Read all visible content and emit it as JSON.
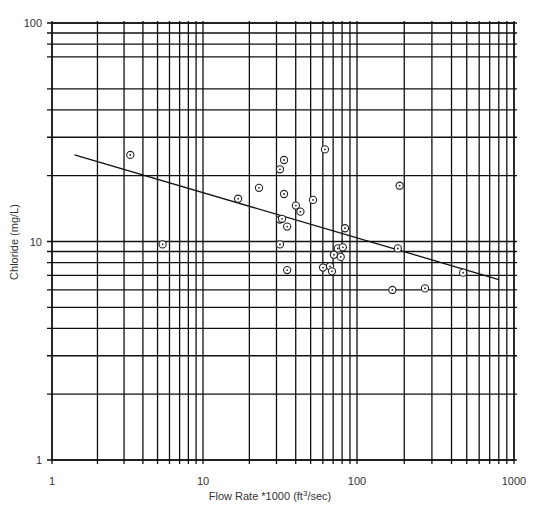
{
  "chart_data": {
    "type": "scatter",
    "title": "",
    "xlabel": "Flow Rate *1000 (ft³/sec)",
    "xlabel_parts": {
      "pre": "Flow Rate *1000 (ft",
      "sup": "3",
      "post": "/sec)"
    },
    "ylabel": "Chloride (mg/L)",
    "xscale": "log",
    "yscale": "log",
    "xlim": [
      1,
      1000
    ],
    "ylim": [
      1,
      100
    ],
    "x_tick_labels": [
      "1",
      "10",
      "100",
      "1000"
    ],
    "y_tick_labels": [
      "1",
      "10",
      "100"
    ],
    "grid": true,
    "grid_x_values": [
      1,
      2,
      3,
      4,
      5,
      6,
      7,
      8,
      9,
      10,
      20,
      30,
      40,
      50,
      60,
      70,
      80,
      90,
      100,
      200,
      300,
      400,
      500,
      600,
      700,
      800,
      900,
      1000
    ],
    "grid_y_values": [
      1,
      2,
      3,
      4,
      5,
      6,
      7,
      8,
      9,
      10,
      20,
      30,
      40,
      50,
      70,
      80,
      90,
      100
    ],
    "series": [
      {
        "name": "Observations",
        "marker": "circle-dot",
        "points": [
          {
            "x": 3.3,
            "y": 24.9
          },
          {
            "x": 5.4,
            "y": 9.7
          },
          {
            "x": 16.9,
            "y": 15.7
          },
          {
            "x": 23.1,
            "y": 17.6
          },
          {
            "x": 33.6,
            "y": 23.6
          },
          {
            "x": 31.6,
            "y": 21.4
          },
          {
            "x": 33.6,
            "y": 16.5
          },
          {
            "x": 51.8,
            "y": 15.5
          },
          {
            "x": 40.1,
            "y": 14.6
          },
          {
            "x": 42.9,
            "y": 13.7
          },
          {
            "x": 31.6,
            "y": 12.6
          },
          {
            "x": 32.6,
            "y": 12.7
          },
          {
            "x": 35.2,
            "y": 11.7
          },
          {
            "x": 31.6,
            "y": 9.7
          },
          {
            "x": 35.2,
            "y": 7.4
          },
          {
            "x": 61.9,
            "y": 26.4
          },
          {
            "x": 83.6,
            "y": 11.5
          },
          {
            "x": 75.1,
            "y": 9.3
          },
          {
            "x": 80.9,
            "y": 9.4
          },
          {
            "x": 70.8,
            "y": 8.7
          },
          {
            "x": 78.4,
            "y": 8.5
          },
          {
            "x": 60.2,
            "y": 7.6
          },
          {
            "x": 66.8,
            "y": 7.7
          },
          {
            "x": 68.8,
            "y": 7.3
          },
          {
            "x": 187,
            "y": 18.0
          },
          {
            "x": 182,
            "y": 9.3
          },
          {
            "x": 474,
            "y": 7.2
          },
          {
            "x": 168,
            "y": 6.0
          },
          {
            "x": 271,
            "y": 6.1
          }
        ]
      },
      {
        "name": "Trend line",
        "type": "line",
        "points": [
          {
            "x": 1.41,
            "y": 24.9
          },
          {
            "x": 800,
            "y": 6.7
          }
        ]
      }
    ]
  },
  "layout": {
    "plot_left": 52,
    "plot_right": 514,
    "plot_top": 23,
    "plot_bottom": 460,
    "x_decade_px": [
      52,
      203,
      357,
      514
    ],
    "colors": {
      "line": "#111111",
      "text": "#333333",
      "background": "#ffffff"
    }
  }
}
